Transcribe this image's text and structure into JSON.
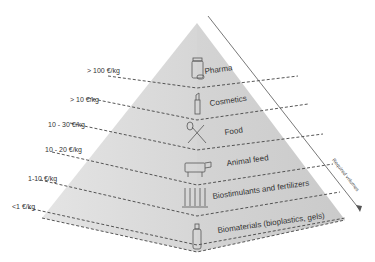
{
  "diagram": {
    "type": "pyramid",
    "axis_label": "Required volumes",
    "colors": {
      "left_face": "#d9d9d9",
      "right_face": "#cfcfcf",
      "dash": "#444444",
      "text": "#333333"
    },
    "tiers": [
      {
        "price": "> 100 €/kg",
        "label": "Pharma",
        "icon": "pill-bottle-icon"
      },
      {
        "price": "> 10 €/kg",
        "label": "Cosmetics",
        "icon": "lipstick-icon"
      },
      {
        "price": "10 - 30 €/kg",
        "label": "Food",
        "icon": "fork-knife-icon"
      },
      {
        "price": "10 - 20 €/kg",
        "label": "Animal feed",
        "icon": "cow-icon"
      },
      {
        "price": "1-10 €/kg",
        "label": "Biostimulants and fertilizers",
        "icon": "wheat-icon"
      },
      {
        "price": "<1 €/kg",
        "label": "Biomaterials (bioplastics, gels)",
        "icon": "bottle-icon"
      }
    ]
  }
}
